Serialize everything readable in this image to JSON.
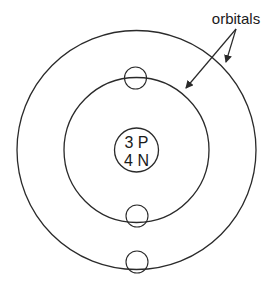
{
  "diagram": {
    "type": "atom-model",
    "nucleus": {
      "line1": "3 P",
      "line2": "4 N"
    },
    "label": {
      "text": "orbitals"
    },
    "orbitals": [
      {
        "name": "inner-orbital",
        "electrons": 2
      },
      {
        "name": "outer-orbital",
        "electrons": 1
      }
    ],
    "colors": {
      "stroke": "#2a2a2a",
      "background": "#ffffff",
      "text": "#1a1a1a"
    }
  }
}
